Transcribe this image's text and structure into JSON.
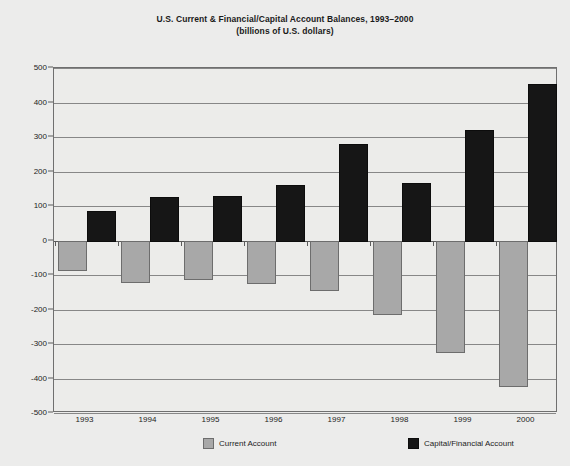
{
  "chart_data": {
    "type": "bar",
    "title": "U.S. Current & Financial/Capital Account Balances, 1993–2000",
    "subtitle": "(billions of U.S. dollars)",
    "xlabel": "",
    "ylabel": "",
    "categories": [
      "1993",
      "1994",
      "1995",
      "1996",
      "1997",
      "1998",
      "1999",
      "2000"
    ],
    "series": [
      {
        "name": "Current Account",
        "color": "#a8a8a8",
        "values": [
          -82,
          -118,
          -110,
          -120,
          -140,
          -210,
          -320,
          -420
        ]
      },
      {
        "name": "Capital/Financial Account",
        "color": "#161616",
        "values": [
          85,
          127,
          130,
          161,
          280,
          168,
          320,
          455
        ]
      }
    ],
    "ylim": [
      -500,
      500
    ],
    "yticks": [
      500,
      400,
      300,
      200,
      100,
      0,
      -100,
      -200,
      -300,
      -400,
      -500
    ],
    "ytick_labels": [
      "500",
      "400",
      "300",
      "200",
      "100",
      "0",
      "-100",
      "-200",
      "-300",
      "-400",
      "-500"
    ],
    "grid": true,
    "legend_position": "bottom"
  },
  "legend": {
    "items": [
      {
        "label": "Current Account",
        "swatch": "current"
      },
      {
        "label": "Capital/Financial Account",
        "swatch": "capital"
      }
    ]
  }
}
